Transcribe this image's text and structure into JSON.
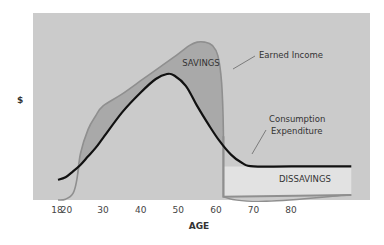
{
  "chart_data": {
    "type": "area",
    "title": "",
    "xlabel": "AGE",
    "ylabel": "$",
    "xlim": [
      18,
      96
    ],
    "ylim": [
      0,
      100
    ],
    "grid": false,
    "x_ticks": [
      18,
      20,
      30,
      40,
      50,
      60,
      70,
      80
    ],
    "x_tick_labels": [
      "18",
      "20",
      "30",
      "40",
      "50",
      "60",
      "70",
      "80"
    ],
    "y_ticks": [],
    "series": [
      {
        "name": "Earned Income",
        "style": "gray-outline",
        "points": [
          [
            18,
            0
          ],
          [
            20,
            0.5
          ],
          [
            22,
            4
          ],
          [
            23,
            12
          ],
          [
            24,
            28
          ],
          [
            26,
            42
          ],
          [
            28,
            50
          ],
          [
            30,
            56
          ],
          [
            35,
            63
          ],
          [
            40,
            71
          ],
          [
            45,
            79
          ],
          [
            50,
            87
          ],
          [
            53,
            92
          ],
          [
            55,
            94
          ],
          [
            57,
            94
          ],
          [
            59,
            92
          ],
          [
            60.5,
            86
          ],
          [
            61.5,
            70
          ],
          [
            62,
            40
          ],
          [
            62,
            2
          ],
          [
            96,
            3
          ]
        ]
      },
      {
        "name": "Consumption Expenditure",
        "style": "black-line",
        "points": [
          [
            18,
            12
          ],
          [
            20,
            13.5
          ],
          [
            22,
            17
          ],
          [
            24,
            21
          ],
          [
            26,
            26
          ],
          [
            28,
            31
          ],
          [
            30,
            37
          ],
          [
            35,
            52
          ],
          [
            40,
            64
          ],
          [
            44,
            72
          ],
          [
            47,
            75
          ],
          [
            49,
            74
          ],
          [
            52,
            68
          ],
          [
            55,
            56
          ],
          [
            58,
            45
          ],
          [
            61,
            35
          ],
          [
            64,
            27
          ],
          [
            67,
            22
          ],
          [
            70,
            20
          ],
          [
            80,
            20
          ],
          [
            96,
            20
          ]
        ]
      }
    ],
    "regions": [
      {
        "name": "SAVINGS",
        "between": [
          "Earned Income",
          "Consumption Expenditure"
        ],
        "x_range": [
          24,
          62
        ]
      },
      {
        "name": "DISSAVINGS",
        "between": [
          "Consumption Expenditure",
          "Earned Income"
        ],
        "x_range": [
          62,
          96
        ]
      }
    ],
    "annotations": [
      {
        "text": "SAVINGS",
        "target": "savings-region"
      },
      {
        "text": "Earned Income",
        "target": "income-curve"
      },
      {
        "text": "Consumption",
        "text2": "Expenditure",
        "target": "consumption-curve"
      },
      {
        "text": "DISSAVINGS",
        "target": "dissavings-region"
      }
    ],
    "colors": {
      "panel": "#cbcbcb",
      "savings_fill": "#a9a9a9",
      "income_line": "#8f8f8f",
      "consumption_line": "#111111",
      "dissavings_fill": "#e2e2e2",
      "dissavings_border": "#8f8f8f"
    }
  }
}
